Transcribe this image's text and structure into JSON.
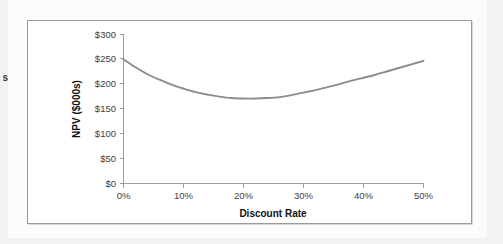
{
  "page": {
    "background_color": "#f2f2f2",
    "paper_color": "#fbfbfb",
    "left_margin_text_fragment": "s"
  },
  "chart_panel": {
    "border_color": "#9a9a9a",
    "background_color": "#ffffff"
  },
  "chart_data": {
    "type": "line",
    "title": "",
    "subtitle": "",
    "xlabel": "Discount Rate",
    "ylabel": "NPV ($000s)",
    "xlim": [
      0,
      50
    ],
    "ylim": [
      0,
      300
    ],
    "grid": false,
    "legend": false,
    "legend_position": "none",
    "line_color": "#8c8c8c",
    "x_tick_labels": [
      "0%",
      "10%",
      "20%",
      "30%",
      "40%",
      "50%"
    ],
    "x_tick_values": [
      0,
      10,
      20,
      30,
      40,
      50
    ],
    "y_tick_labels": [
      "$0",
      "$50",
      "$100",
      "$150",
      "$200",
      "$250",
      "$300"
    ],
    "y_tick_values": [
      0,
      50,
      100,
      150,
      200,
      250,
      300
    ],
    "series": [
      {
        "name": "NPV",
        "x": [
          0,
          2,
          4,
          6,
          8,
          10,
          12,
          14,
          16,
          18,
          20,
          22,
          24,
          26,
          28,
          30,
          32,
          34,
          36,
          38,
          40,
          42,
          44,
          46,
          48,
          50
        ],
        "values": [
          250,
          234,
          220,
          209,
          199,
          191,
          184,
          179,
          175,
          172,
          171,
          171,
          172,
          174,
          178,
          183,
          188,
          194,
          200,
          207,
          213,
          219,
          226,
          233,
          240,
          247
        ]
      }
    ],
    "annotations": {
      "minimum_point": {
        "x": 20,
        "y": 171
      },
      "start_point": {
        "x": 0,
        "y": 250
      },
      "end_point": {
        "x": 50,
        "y": 247
      }
    }
  }
}
